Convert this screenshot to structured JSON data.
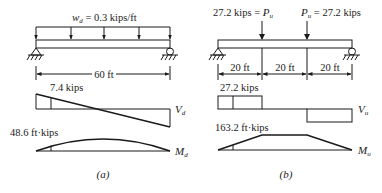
{
  "figure": {
    "panel_a": {
      "caption": "(a)",
      "load_label_prefix": "w",
      "load_label_sub": "d",
      "load_label_value": " = 0.3 kips/ft",
      "span_label": "60 ft",
      "shear_label": "7.4 kips",
      "shear_diagram_prefix": "V",
      "shear_diagram_sub": "d",
      "moment_label": "48.6 ft·kips",
      "moment_diagram_prefix": "M",
      "moment_diagram_sub": "d"
    },
    "panel_b": {
      "caption": "(b)",
      "load_left_value": "27.2 kips = ",
      "load_left_prefix": "P",
      "load_left_sub": "u",
      "load_right_prefix": "P",
      "load_right_sub": "u",
      "load_right_value": " = 27.2 kips",
      "segments": [
        "20 ft",
        "20 ft",
        "20 ft"
      ],
      "shear_label": "27.2 kips",
      "shear_diagram_prefix": "V",
      "shear_diagram_sub": "u",
      "moment_label": "163.2 ft·kips",
      "moment_diagram_prefix": "M",
      "moment_diagram_sub": "u"
    }
  }
}
